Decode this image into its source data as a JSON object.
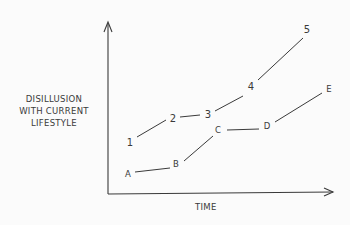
{
  "diagram": {
    "y_axis_label_lines": [
      "DISILLUSION",
      "WITH CURRENT",
      "LIFESTYLE"
    ],
    "x_axis_label": "TIME",
    "series_numbers": {
      "points": [
        {
          "label": "1",
          "x": 130,
          "y": 142
        },
        {
          "label": "2",
          "x": 173,
          "y": 118
        },
        {
          "label": "3",
          "x": 208,
          "y": 114
        },
        {
          "label": "4",
          "x": 251,
          "y": 86
        },
        {
          "label": "5",
          "x": 307,
          "y": 29
        }
      ]
    },
    "series_letters": {
      "points": [
        {
          "label": "A",
          "x": 128,
          "y": 174
        },
        {
          "label": "B",
          "x": 176,
          "y": 164
        },
        {
          "label": "C",
          "x": 218,
          "y": 130
        },
        {
          "label": "D",
          "x": 267,
          "y": 126
        },
        {
          "label": "E",
          "x": 329,
          "y": 89
        }
      ]
    }
  }
}
